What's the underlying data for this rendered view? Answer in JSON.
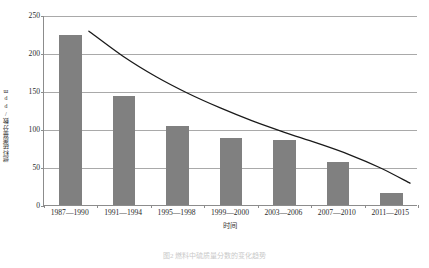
{
  "chart_data": {
    "type": "bar",
    "title": "",
    "xlabel": "时间",
    "ylabel": "燃料硫质量分数/ppm",
    "categories": [
      "1987—1990",
      "1991—1994",
      "1995—1998",
      "1999—2000",
      "2003—2006",
      "2007—2010",
      "2011—2015"
    ],
    "values": [
      224,
      143,
      104,
      88,
      85,
      56,
      16
    ],
    "ylim": [
      0,
      250
    ],
    "yticks": [
      0,
      50,
      100,
      150,
      200,
      250
    ],
    "ytick_labels": [
      "0",
      "50",
      "100",
      "150",
      "200",
      "250"
    ],
    "grid": "horizontal",
    "legend": "none",
    "series": [
      {
        "name": "燃料硫质量分数",
        "type": "bar",
        "values": [
          224,
          143,
          104,
          88,
          85,
          56,
          16
        ],
        "color": "#808080"
      },
      {
        "name": "趋势线",
        "type": "line",
        "color": "#1a1a1a",
        "x": [
          0.34,
          1.0,
          1.6,
          2.2,
          2.8,
          3.4,
          4.0,
          4.6,
          5.2,
          5.8,
          6.35
        ],
        "values": [
          230,
          196,
          170,
          148,
          129,
          112,
          97,
          83,
          68,
          50,
          30
        ]
      }
    ],
    "bar_color": "#808080",
    "curve_color": "#1a1a1a",
    "axis_color": "#8c8c8c",
    "grid_color": "#a9a9a9"
  },
  "figure": {
    "caption": "图2  燃料中硫质量分数的变化趋势"
  }
}
